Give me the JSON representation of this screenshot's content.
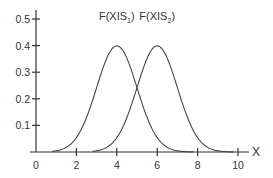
{
  "chart_data": {
    "type": "line",
    "title": "",
    "xlabel": "X",
    "ylabel": "",
    "xlim": [
      0,
      10
    ],
    "ylim": [
      0,
      0.5
    ],
    "x_ticks": [
      0,
      2,
      4,
      6,
      8,
      10
    ],
    "x_tick_labels": [
      "0",
      "2",
      "4",
      "6",
      "8",
      "10"
    ],
    "y_ticks": [
      0.1,
      0.2,
      0.3,
      0.4,
      0.5
    ],
    "y_tick_labels": [
      "0.1",
      "0.2",
      "0.3",
      "0.4",
      "0.5"
    ],
    "grid": false,
    "legend": "inline labels above peaks",
    "series": [
      {
        "name": "F(XIS1)",
        "label_main": "F(XIS",
        "label_sub": "1",
        "label_end": ")",
        "distribution": "normal",
        "mean": 4,
        "sd": 1,
        "x": [
          0,
          1,
          2,
          3,
          3.5,
          4,
          4.5,
          5,
          6,
          7,
          8,
          10
        ],
        "y": [
          0.0001,
          0.0044,
          0.054,
          0.242,
          0.352,
          0.399,
          0.352,
          0.242,
          0.054,
          0.0044,
          0.0001,
          0.0
        ]
      },
      {
        "name": "F(XIS2)",
        "label_main": "F(XIS",
        "label_sub": "2",
        "label_end": ")",
        "distribution": "normal",
        "mean": 6,
        "sd": 1,
        "x": [
          0,
          2,
          3,
          4,
          5,
          5.5,
          6,
          6.5,
          7,
          8,
          9,
          10
        ],
        "y": [
          0.0,
          0.0001,
          0.0044,
          0.054,
          0.242,
          0.352,
          0.399,
          0.352,
          0.242,
          0.054,
          0.0044,
          0.0001
        ]
      }
    ]
  }
}
